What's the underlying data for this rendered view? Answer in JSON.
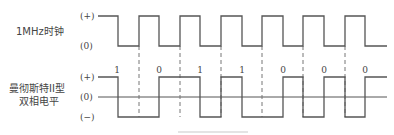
{
  "diagram": {
    "clock": {
      "name": "1MHz时钟",
      "levels": {
        "high": "(+)",
        "low": "(0)"
      },
      "y_high": 16,
      "y_low": 46,
      "points": [
        [
          98,
          16
        ],
        [
          118,
          16
        ],
        [
          118,
          46
        ],
        [
          139,
          46
        ],
        [
          139,
          16
        ],
        [
          159,
          16
        ],
        [
          159,
          46
        ],
        [
          180,
          46
        ],
        [
          180,
          16
        ],
        [
          200,
          16
        ],
        [
          200,
          46
        ],
        [
          221,
          46
        ],
        [
          221,
          16
        ],
        [
          242,
          16
        ],
        [
          242,
          46
        ],
        [
          262,
          46
        ],
        [
          262,
          16
        ],
        [
          283,
          16
        ],
        [
          283,
          46
        ],
        [
          303,
          46
        ],
        [
          303,
          16
        ],
        [
          324,
          16
        ],
        [
          324,
          46
        ],
        [
          345,
          46
        ],
        [
          345,
          16
        ],
        [
          365,
          16
        ],
        [
          365,
          46
        ],
        [
          387,
          46
        ]
      ]
    },
    "manchester": {
      "name_line1": "曼彻斯特II型",
      "name_line2": "双相电平",
      "levels": {
        "high": "(+)",
        "zero": "(0)",
        "low": "(−)"
      },
      "y_high": 77,
      "y_zero": 97,
      "y_low": 117,
      "points": [
        [
          98,
          77
        ],
        [
          118,
          77
        ],
        [
          118,
          117
        ],
        [
          159,
          117
        ],
        [
          159,
          77
        ],
        [
          200,
          77
        ],
        [
          200,
          117
        ],
        [
          221,
          117
        ],
        [
          221,
          77
        ],
        [
          242,
          77
        ],
        [
          242,
          117
        ],
        [
          283,
          117
        ],
        [
          283,
          77
        ],
        [
          303,
          77
        ],
        [
          303,
          117
        ],
        [
          324,
          117
        ],
        [
          324,
          77
        ],
        [
          345,
          77
        ],
        [
          345,
          117
        ],
        [
          365,
          117
        ],
        [
          365,
          77
        ],
        [
          387,
          77
        ]
      ]
    },
    "bits": [
      {
        "label": "1",
        "x": 117
      },
      {
        "label": "0",
        "x": 159
      },
      {
        "label": "1",
        "x": 200
      },
      {
        "label": "1",
        "x": 242
      },
      {
        "label": "0",
        "x": 283
      },
      {
        "label": "0",
        "x": 324
      },
      {
        "label": "0",
        "x": 365
      }
    ],
    "bit_boundaries_x": [
      139,
      180,
      221,
      262,
      303,
      345
    ],
    "colors": {
      "stroke": "#555555",
      "text": "#444444"
    }
  }
}
